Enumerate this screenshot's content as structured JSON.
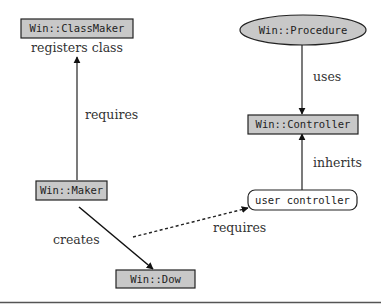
{
  "diagram": {
    "nodes": [
      {
        "id": "classmaker",
        "label": "Win::ClassMaker",
        "shape": "rect",
        "fill": "#c8c8c8"
      },
      {
        "id": "procedure",
        "label": "Win::Procedure",
        "shape": "ellipse",
        "fill": "#c8c8c8"
      },
      {
        "id": "controller",
        "label": "Win::Controller",
        "shape": "rect",
        "fill": "#c8c8c8"
      },
      {
        "id": "maker",
        "label": "Win::Maker",
        "shape": "rect",
        "fill": "#c8c8c8"
      },
      {
        "id": "usercontroller",
        "label": "user controller",
        "shape": "rounded-rect",
        "fill": "#ffffff"
      },
      {
        "id": "dow",
        "label": "Win::Dow",
        "shape": "rect",
        "fill": "#c8c8c8"
      }
    ],
    "edges": [
      {
        "from": "maker",
        "to": "classmaker",
        "label": "requires",
        "style": "solid"
      },
      {
        "from": "procedure",
        "to": "controller",
        "label": "uses",
        "style": "solid"
      },
      {
        "from": "usercontroller",
        "to": "controller",
        "label": "inherits",
        "style": "solid"
      },
      {
        "from": "maker",
        "to": "dow",
        "label": "creates",
        "style": "solid"
      },
      {
        "from": "maker",
        "to": "usercontroller",
        "label": "requires",
        "style": "dotted"
      }
    ],
    "annotations": {
      "classmaker_note": "registers class"
    }
  }
}
